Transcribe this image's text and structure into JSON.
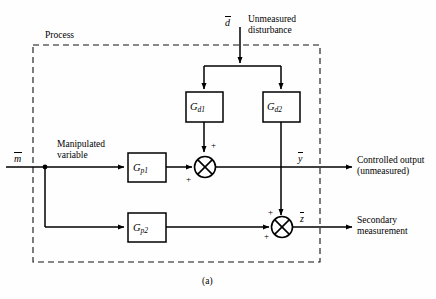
{
  "figure": {
    "caption": "(a)",
    "process_label": "Process"
  },
  "signals": {
    "disturbance": {
      "symbol": "d",
      "overbar": true,
      "description_line1": "Unmeasured",
      "description_line2": "disturbance"
    },
    "manipulated": {
      "symbol": "m",
      "overbar": true,
      "description_line1": "Manipulated",
      "description_line2": "variable"
    },
    "controlled_output": {
      "symbol": "y",
      "overbar": true,
      "description_line1": "Controlled output",
      "description_line2": "(unmeasured)"
    },
    "secondary_measurement": {
      "symbol": "z",
      "overbar": true,
      "description_line1": "Secondary",
      "description_line2": "measurement"
    }
  },
  "blocks": [
    {
      "id": "gd1",
      "base": "G",
      "sub": "d1"
    },
    {
      "id": "gd2",
      "base": "G",
      "sub": "d2"
    },
    {
      "id": "gp1",
      "base": "G",
      "sub": "p1"
    },
    {
      "id": "gp2",
      "base": "G",
      "sub": "p2"
    }
  ],
  "summing_junctions": [
    {
      "id": "sum-primary",
      "signs": [
        {
          "position": "top",
          "value": "+"
        },
        {
          "position": "left-bottom",
          "value": "+"
        }
      ]
    },
    {
      "id": "sum-secondary",
      "signs": [
        {
          "position": "top-left",
          "value": "+"
        },
        {
          "position": "left-bottom",
          "value": "+"
        }
      ]
    }
  ],
  "colors": {
    "line": "#000000",
    "background": "#ffffff",
    "dashed_boundary": "#222222"
  }
}
